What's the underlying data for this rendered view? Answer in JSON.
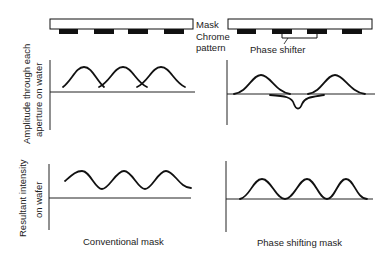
{
  "legend": {
    "mask": "Mask",
    "chrome_line1": "Chrome",
    "chrome_line2": "pattern",
    "phase_shifter": "Phase shifter"
  },
  "y_labels": {
    "amplitude_line1": "Amplitude through each",
    "amplitude_line2": "aperture on water",
    "intensity_line1": "Resultant intensity",
    "intensity_line2": "on wafer"
  },
  "captions": {
    "left": "Conventional mask",
    "right": "Phase shifting mask"
  },
  "colors": {
    "ink": "#111111",
    "chrome": "#111111",
    "background": "#ffffff"
  }
}
